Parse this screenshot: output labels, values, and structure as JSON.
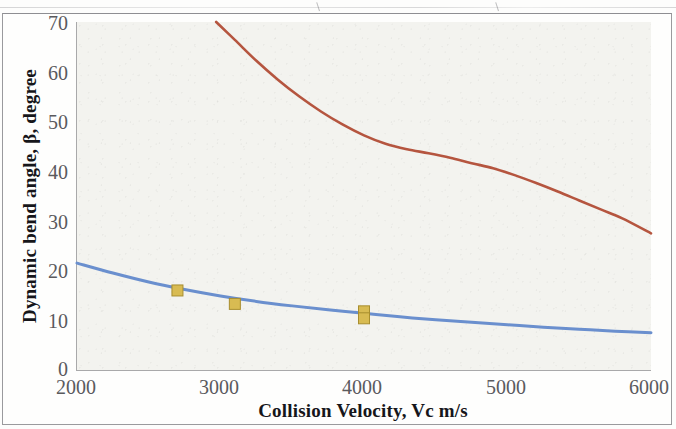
{
  "chart_data": {
    "type": "line",
    "title": "",
    "xlabel": "Collision Velocity, Vc m/s",
    "ylabel": "Dynamic bend angle, β, degree",
    "xlim": [
      2000,
      6000
    ],
    "ylim": [
      0,
      70
    ],
    "xticks": [
      "2000",
      "3000",
      "4000",
      "5000",
      "6000"
    ],
    "yticks": [
      "0",
      "10",
      "20",
      "30",
      "40",
      "50",
      "60",
      "70"
    ],
    "grid": false,
    "legend": "none",
    "series": [
      {
        "name": "upper-curve",
        "color": "#b5553f",
        "style": "line",
        "x": [
          2970,
          3100,
          3250,
          3400,
          3550,
          3700,
          3850,
          4000,
          4150,
          4300,
          4450,
          4600,
          4750,
          4900,
          5050,
          5200,
          5350,
          5500,
          5650,
          5800,
          6000
        ],
        "y": [
          70.0,
          66.4,
          62.2,
          58.4,
          55.0,
          52.0,
          49.4,
          47.2,
          45.5,
          44.4,
          43.6,
          42.7,
          41.6,
          40.6,
          39.2,
          37.6,
          35.9,
          34.1,
          32.3,
          30.5,
          27.5
        ]
      },
      {
        "name": "lower-curve",
        "color": "#6a8fce",
        "style": "line",
        "x": [
          2000,
          2250,
          2500,
          2750,
          3000,
          3250,
          3500,
          3750,
          4000,
          4250,
          4500,
          4750,
          5000,
          5250,
          5500,
          5750,
          6000
        ],
        "y": [
          21.5,
          19.5,
          17.7,
          16.2,
          14.9,
          13.8,
          12.9,
          12.1,
          11.4,
          10.7,
          10.1,
          9.6,
          9.1,
          8.6,
          8.2,
          7.8,
          7.5
        ]
      },
      {
        "name": "data-markers",
        "color": "#c8a93c",
        "style": "square-markers",
        "x": [
          2700,
          3100,
          4000,
          4000
        ],
        "y": [
          16.0,
          13.3,
          11.8,
          10.4
        ]
      }
    ]
  },
  "axes": {
    "y_title": "Dynamic bend angle, β, degree",
    "x_title": "Collision Velocity, Vc m/s",
    "y_labels": [
      "70",
      "60",
      "50",
      "40",
      "30",
      "20",
      "10",
      "0"
    ],
    "x_labels": [
      "2000",
      "3000",
      "4000",
      "5000",
      "6000"
    ]
  },
  "colors": {
    "upper_curve": "#b5553f",
    "lower_curve": "#6a8fce",
    "marker_fill": "#d8bb52",
    "marker_stroke": "#a88e2e",
    "plot_background": "#f3f3ef",
    "axis": "#a9a9aa",
    "tick_text": "#5a5a5d",
    "title_text": "#16161a"
  }
}
